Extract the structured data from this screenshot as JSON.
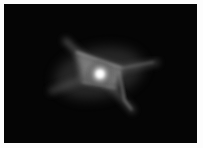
{
  "image": {
    "subject": "bipolar nebula with X-shaped glowing structure",
    "palette": {
      "background": "#050505",
      "glow": "#e8e8e8",
      "border": "#fdfdfd"
    }
  }
}
